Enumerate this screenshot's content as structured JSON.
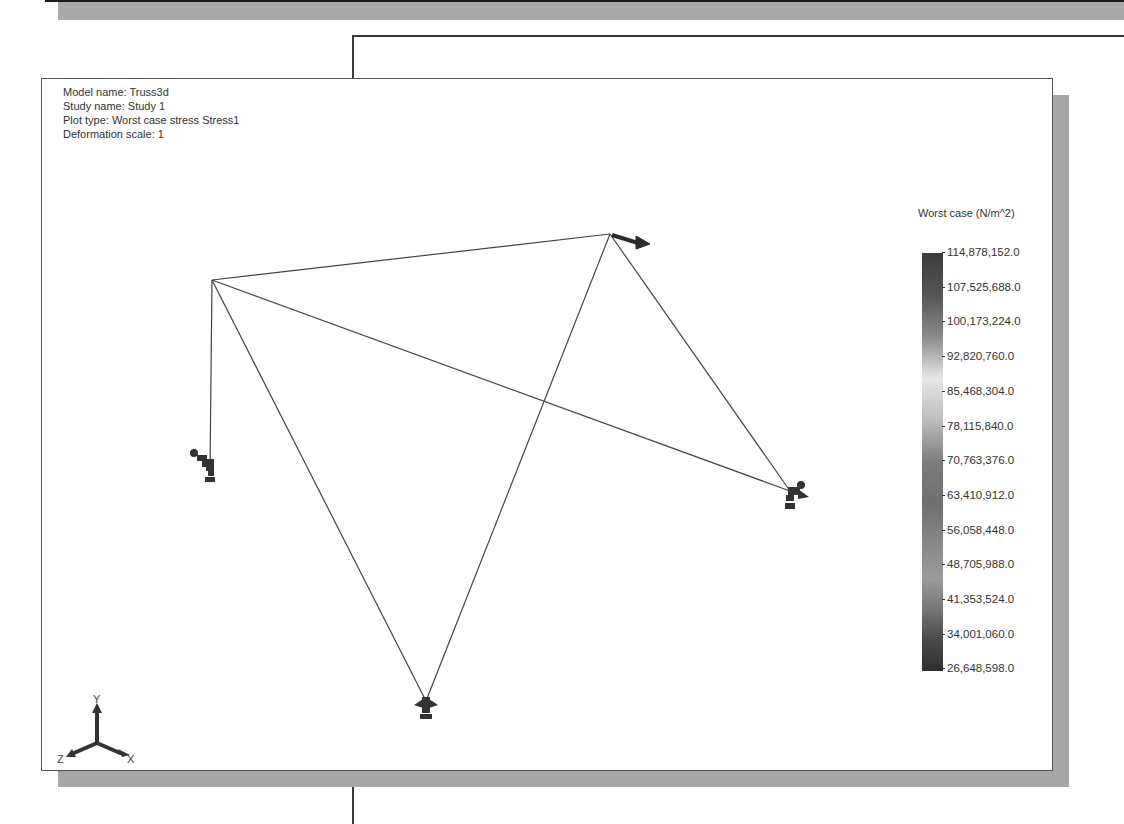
{
  "window": {
    "background_color": "#ffffff",
    "shadow_color": "#a7a7a7"
  },
  "plot_info": {
    "model_name": "Model name: Truss3d",
    "study_name": "Study name: Study 1",
    "plot_type": "Plot type: Worst case stress Stress1",
    "deformation_scale": "Deformation scale: 1"
  },
  "legend": {
    "title": "Worst case (N/m^2)",
    "values": [
      "114,878,152.0",
      "107,525,688.0",
      "100,173,224.0",
      "92,820,760.0",
      "85,468,304.0",
      "78,115,840.0",
      "70,763,376.0",
      "63,410,912.0",
      "56,058,448.0",
      "48,705,988.0",
      "41,353,524.0",
      "34,001,060.0",
      "26,648,598.0"
    ]
  },
  "triad": {
    "x_label": "X",
    "y_label": "Y",
    "z_label": "Z"
  },
  "truss": {
    "nodes": [
      {
        "id": "A",
        "x": 170,
        "y": 201
      },
      {
        "id": "B",
        "x": 568,
        "y": 155
      },
      {
        "id": "C",
        "x": 168,
        "y": 392
      },
      {
        "id": "D",
        "x": 384,
        "y": 622
      },
      {
        "id": "E",
        "x": 748,
        "y": 412
      }
    ],
    "members": [
      [
        "A",
        "B"
      ],
      [
        "A",
        "C"
      ],
      [
        "A",
        "D"
      ],
      [
        "A",
        "E"
      ],
      [
        "B",
        "D"
      ],
      [
        "B",
        "E"
      ]
    ],
    "line_color": "#444444"
  }
}
